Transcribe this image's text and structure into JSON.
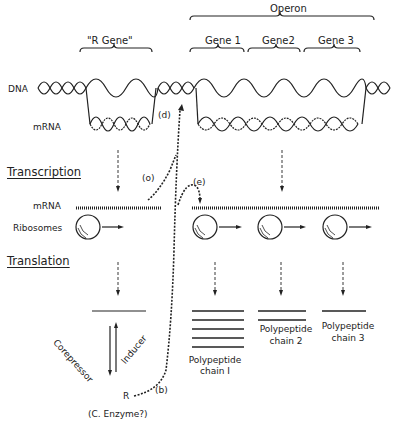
{
  "labels": {
    "r_gene": "\"R Gene\"",
    "operon": "Operon",
    "gene1": "Gene 1",
    "gene2": "Gene2",
    "gene3": "Gene 3",
    "dna": "DNA",
    "mrna_top": "mRNA",
    "transcription": "Transcription",
    "mrna_mid": "mRNA",
    "ribosomes": "Ribosomes",
    "translation": "Translation",
    "corepressor": "Corepressor",
    "inducer": "Inducer",
    "poly1_a": "Polypeptide",
    "poly1_b": "chain I",
    "poly2_a": "Polypeptide",
    "poly2_b": "chain 2",
    "poly3_a": "Polypeptide",
    "poly3_b": "chain 3",
    "r": "R",
    "enzyme": "(C. Enzyme?)",
    "a": "(o)",
    "b": "(b)",
    "d": "(d)",
    "e": "(e)"
  },
  "colors": {
    "ink": "#222222",
    "background": "#ffffff"
  }
}
